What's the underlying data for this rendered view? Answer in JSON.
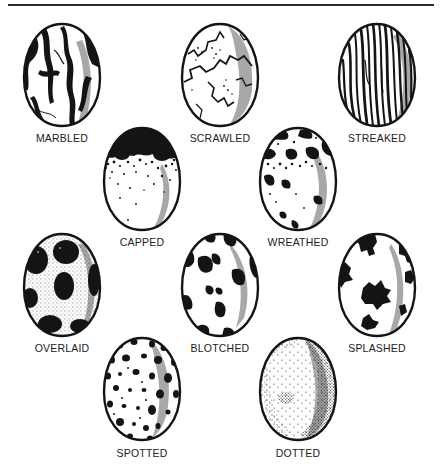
{
  "diagram": {
    "title": "",
    "colors": {
      "ink": "#141414",
      "shade": "#a8a8a8",
      "shell": "#ffffff",
      "label": "#222222"
    },
    "eggs": [
      {
        "id": "marbled",
        "label": "MARBLED",
        "pattern": "marbled",
        "row": 1,
        "col": 1
      },
      {
        "id": "scrawled",
        "label": "SCRAWLED",
        "pattern": "scrawled",
        "row": 1,
        "col": 2
      },
      {
        "id": "streaked",
        "label": "STREAKED",
        "pattern": "streaked",
        "row": 1,
        "col": 3
      },
      {
        "id": "capped",
        "label": "CAPPED",
        "pattern": "capped",
        "row": 2,
        "col": 1
      },
      {
        "id": "wreathed",
        "label": "WREATHED",
        "pattern": "wreathed",
        "row": 2,
        "col": 2
      },
      {
        "id": "overlaid",
        "label": "OVERLAID",
        "pattern": "overlaid",
        "row": 3,
        "col": 1
      },
      {
        "id": "blotched",
        "label": "BLOTCHED",
        "pattern": "blotched",
        "row": 3,
        "col": 2
      },
      {
        "id": "splashed",
        "label": "SPLASHED",
        "pattern": "splashed",
        "row": 3,
        "col": 3
      },
      {
        "id": "spotted",
        "label": "SPOTTED",
        "pattern": "spotted",
        "row": 4,
        "col": 1
      },
      {
        "id": "dotted",
        "label": "DOTTED",
        "pattern": "dotted",
        "row": 4,
        "col": 2
      }
    ]
  }
}
